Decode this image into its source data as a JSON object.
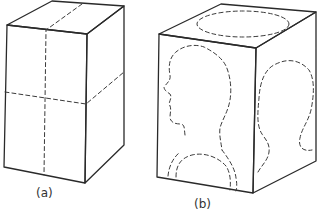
{
  "figure": {
    "panels": [
      {
        "id": "a",
        "label": "(a)",
        "description": "Rectangular block with dashed lines dividing the front and right faces into quarters"
      },
      {
        "id": "b",
        "label": "(b)",
        "description": "Rectangular block with dashed head profile on front face, dashed oval on top face, dashed outline on right face, and dashed arcs at bottom of front face"
      }
    ],
    "colors": {
      "line": "#2a2a2a",
      "background": "#ffffff"
    }
  }
}
